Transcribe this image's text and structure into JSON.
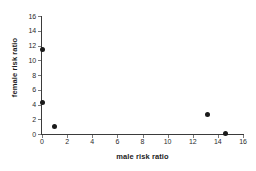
{
  "chart_data": {
    "type": "scatter",
    "title": "",
    "xlabel": "male risk ratio",
    "ylabel": "female risk ratio",
    "xlim": [
      0,
      16
    ],
    "ylim": [
      0,
      16
    ],
    "xticks": [
      "0",
      "2",
      "4",
      "6",
      "8",
      "10",
      "12",
      "14",
      "16"
    ],
    "yticks": [
      "0",
      "2",
      "4",
      "6",
      "8",
      "10",
      "12",
      "14",
      "16"
    ],
    "grid": false,
    "legend": false,
    "marker_color": "#1a1a1a",
    "axis_color": "#3b3b3b",
    "background": "#ffffff",
    "points": [
      {
        "x": 0,
        "y": 11.5
      },
      {
        "x": 0,
        "y": 4.3
      },
      {
        "x": 1.0,
        "y": 1.0
      },
      {
        "x": 13.2,
        "y": 2.7
      },
      {
        "x": 14.6,
        "y": 0.1
      }
    ]
  }
}
